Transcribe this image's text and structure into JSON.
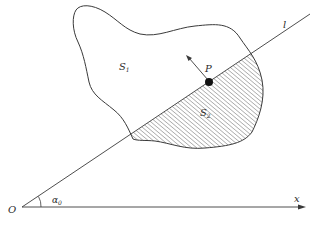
{
  "diagram": {
    "labels": {
      "region_upper": "S",
      "region_upper_sub": "1",
      "region_lower": "S",
      "region_lower_sub": "2",
      "point": "P",
      "line": "l",
      "origin": "O",
      "axis": "x",
      "angle": "α",
      "angle_sub": "0"
    },
    "colors": {
      "stroke": "#3a3a3a",
      "hatch": "#5a5a5a",
      "point_fill": "#111111",
      "background": "#ffffff"
    },
    "elements": {
      "origin_point": [
        22,
        207
      ],
      "x_axis_end": [
        305,
        207
      ],
      "line_end": [
        310,
        14
      ],
      "point_P": [
        209,
        82
      ],
      "arrow_tip": [
        186,
        55
      ]
    }
  }
}
